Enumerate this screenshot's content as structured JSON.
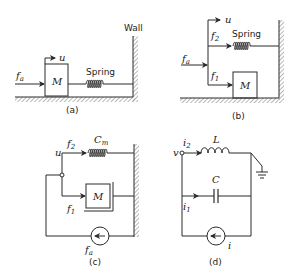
{
  "figure": {
    "panels": [
      {
        "id": "a",
        "caption": "(a)",
        "labels": {
          "wall": "Wall",
          "spring": "Spring",
          "mass": "M",
          "force": "f",
          "force_sub": "a",
          "velocity": "u"
        }
      },
      {
        "id": "b",
        "caption": "(b)",
        "labels": {
          "spring": "Spring",
          "mass": "M",
          "force": "f",
          "force_sub": "a",
          "velocity": "u",
          "f2": "f",
          "f2_sub": "2",
          "f1": "f",
          "f1_sub": "1"
        }
      },
      {
        "id": "c",
        "caption": "(c)",
        "labels": {
          "compliance": "C",
          "compliance_sub": "m",
          "mass": "M",
          "velocity": "u",
          "f2": "f",
          "f2_sub": "2",
          "f1": "f",
          "f1_sub": "1",
          "source": "f",
          "source_sub": "a"
        }
      },
      {
        "id": "d",
        "caption": "(d)",
        "labels": {
          "inductor": "L",
          "capacitor": "C",
          "voltage": "v",
          "i2": "i",
          "i2_sub": "2",
          "i1": "i",
          "i1_sub": "1",
          "source": "i"
        }
      }
    ],
    "colors": {
      "ink": "#2a2a2a",
      "hatch": "#888888",
      "background": "#ffffff"
    }
  }
}
